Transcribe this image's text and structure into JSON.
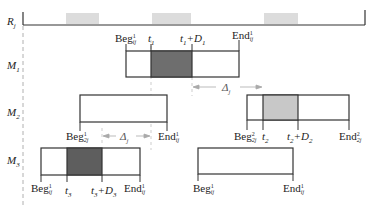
{
  "rows": {
    "resource": {
      "label": "R",
      "sub": "j"
    },
    "m1": {
      "label": "M",
      "sub": "1"
    },
    "m2": {
      "label": "M",
      "sub": "2"
    },
    "m3": {
      "label": "M",
      "sub": "3"
    }
  },
  "m1_labels": {
    "beg": {
      "main": "Beg",
      "sup": "1",
      "sub": "ij"
    },
    "t": {
      "main": "t",
      "sub": "1"
    },
    "t_plus_d": {
      "main": "t",
      "sub": "1",
      "plus": "+D",
      "dsub": "1"
    },
    "end": {
      "main": "End",
      "sup": "1",
      "sub": "ij"
    }
  },
  "delta_label": {
    "main": "Δ",
    "sub": "j"
  },
  "m2_labels": {
    "beg1": {
      "main": "Beg",
      "sup": "1",
      "sub": "2j"
    },
    "end1": {
      "main": "End",
      "sup": "1",
      "sub": "ij"
    },
    "beg2": {
      "main": "Beg",
      "sup": "2",
      "sub": "2j"
    },
    "t": {
      "main": "t",
      "sub": "2"
    },
    "t_plus_d": {
      "main": "t",
      "sub": "2",
      "plus": "+D",
      "dsub": "2"
    },
    "end2": {
      "main": "End",
      "sup": "2",
      "sub": "2j"
    }
  },
  "m3_labels": {
    "beg1": {
      "main": "Beg",
      "sup": "1",
      "sub": "ij"
    },
    "t": {
      "main": "t",
      "sub": "3"
    },
    "t_plus_d": {
      "main": "t",
      "sub": "3",
      "plus": "+D",
      "dsub": "3"
    },
    "end1": {
      "main": "End",
      "sup": "1",
      "sub": "ij"
    },
    "beg2": {
      "main": "Beg",
      "sup": "1",
      "sub": "ij"
    },
    "end2": {
      "main": "End",
      "sup": "1",
      "sub": "ij"
    }
  },
  "colors": {
    "line": "#333333",
    "dashed": "#b0b0b0",
    "dark_fill": "#6e6e6e",
    "light_fill": "#c8c8c8",
    "resource_block": "#dcdcdc"
  }
}
